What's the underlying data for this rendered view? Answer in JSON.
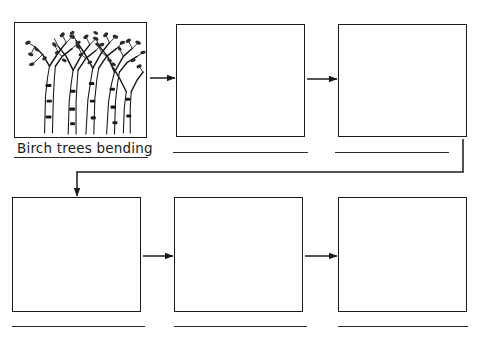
{
  "worksheet": {
    "title": "Sequence storyboard worksheet",
    "background_color": "#ffffff",
    "line_color": "#1a1a1a",
    "panel_count": 6
  },
  "panels": [
    {
      "id": "panel-1",
      "row": 1,
      "position": 1,
      "type": "illustration",
      "content": "birch-trees-illustration",
      "caption": "Birch trees bending",
      "caption_line": true,
      "x": 14,
      "y": 22,
      "w": 133,
      "h": 116
    },
    {
      "id": "panel-2",
      "row": 1,
      "position": 2,
      "type": "blank",
      "content": "",
      "caption": "",
      "caption_line": true,
      "x": 176,
      "y": 24,
      "w": 129,
      "h": 113
    },
    {
      "id": "panel-3",
      "row": 1,
      "position": 3,
      "type": "blank",
      "content": "",
      "caption": "",
      "caption_line": true,
      "x": 338,
      "y": 24,
      "w": 129,
      "h": 113
    },
    {
      "id": "panel-4",
      "row": 2,
      "position": 1,
      "type": "blank",
      "content": "",
      "caption": "",
      "caption_line": true,
      "x": 12,
      "y": 197,
      "w": 129,
      "h": 115
    },
    {
      "id": "panel-5",
      "row": 2,
      "position": 2,
      "type": "blank",
      "content": "",
      "caption": "",
      "caption_line": true,
      "x": 174,
      "y": 197,
      "w": 129,
      "h": 115
    },
    {
      "id": "panel-6",
      "row": 2,
      "position": 3,
      "type": "blank",
      "content": "",
      "caption": "",
      "caption_line": true,
      "x": 338,
      "y": 197,
      "w": 129,
      "h": 115
    }
  ],
  "caption_lines": [
    {
      "id": "caption-line-1",
      "x": 14,
      "y": 157,
      "w": 134
    },
    {
      "id": "caption-line-2",
      "x": 173,
      "y": 152,
      "w": 135
    },
    {
      "id": "caption-line-3",
      "x": 335,
      "y": 152,
      "w": 114
    },
    {
      "id": "caption-line-4",
      "x": 12,
      "y": 326,
      "w": 133
    },
    {
      "id": "caption-line-5",
      "x": 174,
      "y": 326,
      "w": 133
    },
    {
      "id": "caption-line-6",
      "x": 338,
      "y": 326,
      "w": 130
    }
  ],
  "connectors": [
    {
      "id": "arrow-1-to-2",
      "type": "straight-right",
      "from": "panel-1",
      "to": "panel-2",
      "x1": 150,
      "y1": 78,
      "x2": 174,
      "y2": 78
    },
    {
      "id": "arrow-2-to-3",
      "type": "straight-right",
      "from": "panel-2",
      "to": "panel-3",
      "x1": 307,
      "y1": 79,
      "x2": 336,
      "y2": 79
    },
    {
      "id": "arrow-3-to-4",
      "type": "elbow-wrap",
      "from": "panel-3",
      "to": "panel-4",
      "path": "M463,138 L463,172 L77,172 L77,195"
    },
    {
      "id": "arrow-4-to-5",
      "type": "straight-right",
      "from": "panel-4",
      "to": "panel-5",
      "x1": 143,
      "y1": 256,
      "x2": 172,
      "y2": 256
    },
    {
      "id": "arrow-5-to-6",
      "type": "straight-right",
      "from": "panel-5",
      "to": "panel-6",
      "x1": 305,
      "y1": 256,
      "x2": 336,
      "y2": 256
    }
  ],
  "illustration": {
    "name": "birch-trees-illustration",
    "alt": "Line drawing of birch trees bending with leafy branches",
    "caption": "Birch trees bending"
  }
}
